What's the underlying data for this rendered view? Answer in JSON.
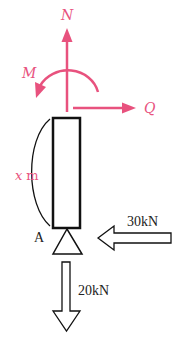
{
  "diagram": {
    "internal_forces": {
      "axial_label": "N",
      "moment_label": "M",
      "shear_label": "Q",
      "color": "#e8527e"
    },
    "beam": {
      "length_label": "x m",
      "length_var": "x",
      "length_unit": "m",
      "support_label": "A"
    },
    "loads": {
      "horizontal": "30kN",
      "vertical": "20kN"
    }
  }
}
